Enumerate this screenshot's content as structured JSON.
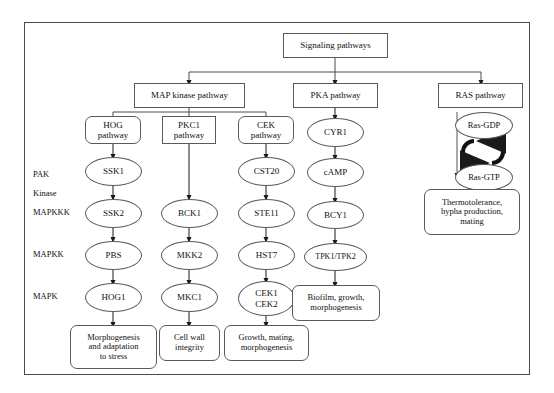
{
  "diagram": {
    "title_box": {
      "label": "Signaling pathways"
    },
    "top_pathways": [
      {
        "id": "map",
        "label": "MAP kinase pathway"
      },
      {
        "id": "pka",
        "label": "PKA pathway"
      },
      {
        "id": "ras",
        "label": "RAS pathway"
      }
    ],
    "sub_pathways": [
      {
        "id": "hog",
        "line1": "HOG",
        "line2": "pathway"
      },
      {
        "id": "pkc1",
        "line1": "PKC1",
        "line2": "pathway"
      },
      {
        "id": "cek",
        "line1": "CEK",
        "line2": "pathway"
      }
    ],
    "row_labels": [
      {
        "id": "pak",
        "line1": "PAK",
        "line2": "Kinase"
      },
      {
        "id": "mapkkk",
        "line1": "MAPKKK",
        "line2": ""
      },
      {
        "id": "mapkk",
        "line1": "MAPKK",
        "line2": ""
      },
      {
        "id": "mapk",
        "line1": "MAPK",
        "line2": ""
      }
    ],
    "hog_column": {
      "pak": "SSK1",
      "mapkkk": "SSK2",
      "mapkk": "PBS",
      "mapk": "HOG1",
      "outcome_line1": "Morphogenesis",
      "outcome_line2": "and adaptation",
      "outcome_line3": "to stress"
    },
    "pkc1_column": {
      "mapkkk": "BCK1",
      "mapkk": "MKK2",
      "mapk": "MKC1",
      "outcome_line1": "Cell wall",
      "outcome_line2": "integrity"
    },
    "cek_column": {
      "pak": "CST20",
      "mapkkk": "STE11",
      "mapkk": "HST7",
      "mapk_line1": "CEK1",
      "mapk_line2": "CEK2",
      "outcome_line1": "Growth, mating,",
      "outcome_line2": "morphogenesis"
    },
    "pka_column": {
      "node1": "CYR1",
      "node2": "cAMP",
      "node3": "BCY1",
      "node4": "TPK1/TPK2",
      "outcome_line1": "Biofilm, growth,",
      "outcome_line2": "morphogenesis"
    },
    "ras_column": {
      "gdp": "Ras-GDP",
      "gtp": "Ras-GTP",
      "outcome_line1": "Thermotolerance,",
      "outcome_line2": "hypha production,",
      "outcome_line3": "mating"
    },
    "colors": {
      "frame": "#4a4a4a",
      "node_border": "#5a5a5a",
      "text": "#111111",
      "arrow": "#1a1a1a",
      "background": "#ffffff"
    }
  }
}
